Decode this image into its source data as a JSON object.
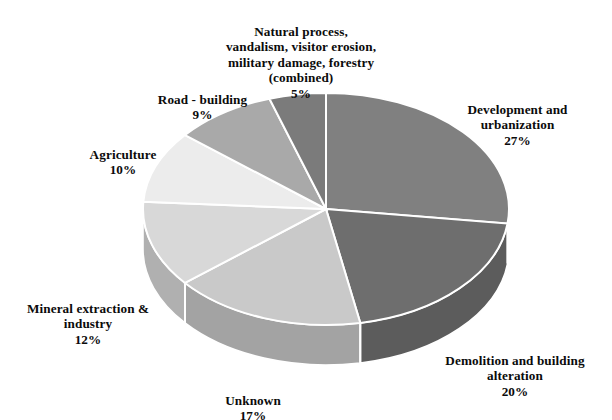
{
  "chart_data": {
    "type": "pie",
    "title": "",
    "subtitle": "",
    "xlabel": "",
    "ylabel": "",
    "grid": false,
    "legend_position": "none",
    "label_format": "name above percent",
    "start_angle_deg": 0,
    "direction": "clockwise",
    "style": "3d-extruded-pie",
    "categories": [
      "Development and urbanization",
      "Demolition and building alteration",
      "Unknown",
      "Mineral extraction & industry",
      "Agriculture",
      "Road - building",
      "Natural process, vandalism, visitor erosion, military damage, forestry (combined)"
    ],
    "values": [
      27,
      20,
      17,
      12,
      10,
      9,
      5
    ],
    "value_labels": [
      "27%",
      "20%",
      "17%",
      "12%",
      "10%",
      "9%",
      "5%"
    ],
    "colors": [
      "#808080",
      "#6e6e6e",
      "#c9c9c9",
      "#d8d8d8",
      "#ececec",
      "#a9a9a9",
      "#7b7b7b"
    ],
    "side_colors": [
      "#6b6b6b",
      "#5c5c5c",
      "#a3a3a3",
      "#b0b0b0",
      "#c2c2c2",
      "#8c8c8c",
      "#666666"
    ],
    "slice_border_color": "#ffffff",
    "total": 100
  },
  "labels": {
    "natural": {
      "name": "Natural process,\nvandalism, visitor erosion,\nmilitary damage, forestry\n(combined)",
      "pct": "5%"
    },
    "road": {
      "name": "Road - building",
      "pct": "9%"
    },
    "agriculture": {
      "name": "Agriculture",
      "pct": "10%"
    },
    "mineral": {
      "name": "Mineral extraction &\nindustry",
      "pct": "12%"
    },
    "unknown": {
      "name": "Unknown",
      "pct": "17%"
    },
    "demolition": {
      "name": "Demolition and building\nalteration",
      "pct": "20%"
    },
    "development": {
      "name": "Development and\nurbanization",
      "pct": "27%"
    }
  }
}
